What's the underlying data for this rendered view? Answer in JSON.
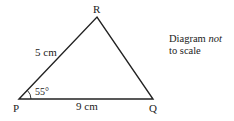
{
  "diagram": {
    "type": "triangle",
    "vertices": {
      "P": {
        "label": "P",
        "x": 19,
        "y": 99
      },
      "Q": {
        "label": "Q",
        "x": 153,
        "y": 99
      },
      "R": {
        "label": "R",
        "x": 97,
        "y": 17
      }
    },
    "sides": {
      "PR": {
        "label": "5 cm"
      },
      "PQ": {
        "label": "9 cm"
      }
    },
    "angles": {
      "P": {
        "label": "55°"
      }
    },
    "note": {
      "line1": "Diagram",
      "emphasis": "not",
      "line2": "to scale"
    },
    "colors": {
      "stroke": "#222222",
      "background": "#ffffff"
    }
  }
}
